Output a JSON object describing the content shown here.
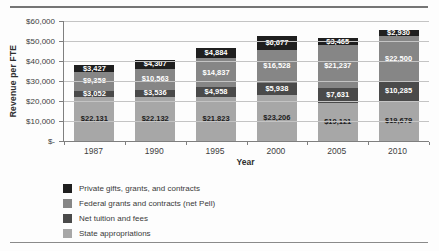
{
  "chart_data": {
    "type": "bar",
    "variant": "stacked",
    "title": "",
    "xlabel": "Year",
    "ylabel": "Revenue per FTE",
    "categories": [
      "1987",
      "1990",
      "1995",
      "2000",
      "2005",
      "2010"
    ],
    "stack_order": "bottom-to-top",
    "series": [
      {
        "name": "State appropriations",
        "color": "#a7a7a7",
        "label_color": "#1c1c1c",
        "values": [
          22131,
          22132,
          21823,
          23206,
          19121,
          19679
        ]
      },
      {
        "name": "Net tuition and fees",
        "color": "#4a4a4a",
        "label_color": "#ffffff",
        "values": [
          3052,
          3536,
          4958,
          5938,
          7631,
          10285
        ]
      },
      {
        "name": "Federal grants and contracts (net Pell)",
        "color": "#868686",
        "label_color": "#ffffff",
        "values": [
          9358,
          10563,
          14837,
          16528,
          21237,
          22500
        ]
      },
      {
        "name": "Private gifts, grants, and contracts",
        "color": "#1f1f1f",
        "label_color": "#ffffff",
        "values": [
          3427,
          4307,
          4884,
          6677,
          3465,
          2930
        ]
      }
    ],
    "value_prefix": "$",
    "ylim": [
      0,
      60000
    ],
    "grid": true,
    "y_ticks": [
      {
        "label": "$60,000",
        "value": 60000
      },
      {
        "label": "$50,000",
        "value": 50000
      },
      {
        "label": "$40,000",
        "value": 40000
      },
      {
        "label": "$30,000",
        "value": 30000
      },
      {
        "label": "$20,000",
        "value": 20000
      },
      {
        "label": "$10,000",
        "value": 10000
      },
      {
        "label": "$-",
        "value": 0
      }
    ],
    "legend_position": "bottom-left",
    "legend": [
      {
        "label": "Private gifts, grants, and contracts",
        "color": "#1f1f1f"
      },
      {
        "label": "Federal grants and contracts (net Pell)",
        "color": "#868686"
      },
      {
        "label": "Net tuition and fees",
        "color": "#4a4a4a"
      },
      {
        "label": "State appropriations",
        "color": "#a7a7a7"
      }
    ]
  }
}
